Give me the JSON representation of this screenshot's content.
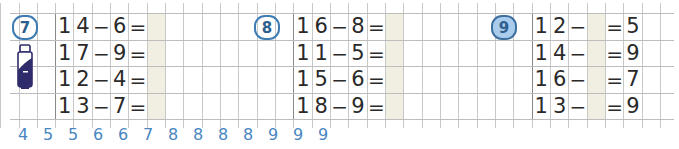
{
  "grid": {
    "cell_width": 18.33,
    "row_lines_y": [
      13,
      40,
      66,
      93,
      119
    ],
    "first_vline_x": 18.5,
    "columns": 36
  },
  "colors": {
    "badge_outline": "#3e7cb3",
    "badge_text": "#2f5f8f",
    "badge_fill_active": "#a9cbec",
    "answer_shade": "#f1efe1",
    "number_line": "#4a86bf",
    "digits": "#2a2a2a"
  },
  "exercises": [
    {
      "number": "7",
      "icon": "bottle-icon",
      "rows": [
        {
          "a": [
            "1",
            "4"
          ],
          "op": "−",
          "b": "6",
          "eq": "=",
          "answer": ""
        },
        {
          "a": [
            "1",
            "7"
          ],
          "op": "−",
          "b": "9",
          "eq": "=",
          "answer": ""
        },
        {
          "a": [
            "1",
            "2"
          ],
          "op": "−",
          "b": "4",
          "eq": "=",
          "answer": ""
        },
        {
          "a": [
            "1",
            "3"
          ],
          "op": "−",
          "b": "7",
          "eq": "=",
          "answer": ""
        }
      ]
    },
    {
      "number": "8",
      "rows": [
        {
          "a": [
            "1",
            "6"
          ],
          "op": "−",
          "b": "8",
          "eq": "=",
          "answer": ""
        },
        {
          "a": [
            "1",
            "1"
          ],
          "op": "−",
          "b": "5",
          "eq": "=",
          "answer": ""
        },
        {
          "a": [
            "1",
            "5"
          ],
          "op": "−",
          "b": "6",
          "eq": "=",
          "answer": ""
        },
        {
          "a": [
            "1",
            "8"
          ],
          "op": "−",
          "b": "9",
          "eq": "=",
          "answer": ""
        }
      ]
    },
    {
      "number": "9",
      "rows": [
        {
          "a": [
            "1",
            "2"
          ],
          "op": "−",
          "missing": "",
          "eq": "=",
          "result": "5"
        },
        {
          "a": [
            "1",
            "4"
          ],
          "op": "−",
          "missing": "",
          "eq": "=",
          "result": "9"
        },
        {
          "a": [
            "1",
            "6"
          ],
          "op": "−",
          "missing": "",
          "eq": "=",
          "result": "7"
        },
        {
          "a": [
            "1",
            "3"
          ],
          "op": "−",
          "missing": "",
          "eq": "=",
          "result": "9"
        }
      ]
    }
  ],
  "number_line": [
    "4",
    "5",
    "5",
    "6",
    "6",
    "7",
    "8",
    "8",
    "8",
    "8",
    "9",
    "9",
    "9"
  ]
}
